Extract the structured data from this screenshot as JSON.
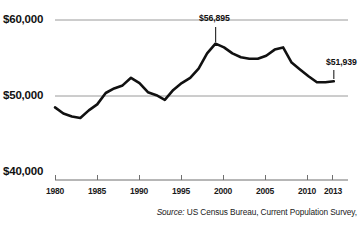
{
  "axes": {
    "y_labels": [
      "$60,000",
      "$50,000",
      "$40,000"
    ],
    "x_labels": [
      "1980",
      "1985",
      "1990",
      "1995",
      "2000",
      "2005",
      "2010",
      "2013"
    ]
  },
  "annotations": {
    "peak_label": "$56,895",
    "last_label": "$51,939"
  },
  "source": {
    "prefix": "Source:",
    "text": "US Census Bureau, Current Population Survey,"
  },
  "colors": {
    "line": "#111111",
    "gridline": "#999999",
    "axis": "#666666",
    "text": "#1a1a1a",
    "background": "#ffffff"
  },
  "chart_data": {
    "type": "line",
    "title": "",
    "xlabel": "",
    "ylabel": "",
    "xlim": [
      1980,
      2013
    ],
    "ylim": [
      40000,
      60000
    ],
    "grid": true,
    "gridlines": [
      40000,
      50000,
      60000
    ],
    "legend": "none",
    "x_tick_values": [
      1980,
      1985,
      1990,
      1995,
      2000,
      2005,
      2010,
      2013
    ],
    "x": [
      1980,
      1981,
      1982,
      1983,
      1984,
      1985,
      1986,
      1987,
      1988,
      1989,
      1990,
      1991,
      1992,
      1993,
      1994,
      1995,
      1996,
      1997,
      1998,
      1999,
      2000,
      2001,
      2002,
      2003,
      2004,
      2005,
      2006,
      2007,
      2008,
      2009,
      2010,
      2011,
      2012,
      2013
    ],
    "series": [
      {
        "name": "Median household income",
        "values": [
          48500,
          47700,
          47300,
          47100,
          48100,
          48900,
          50400,
          51000,
          51400,
          52400,
          51700,
          50500,
          50100,
          49500,
          50800,
          51700,
          52400,
          53600,
          55600,
          56895,
          56400,
          55600,
          55100,
          54900,
          54900,
          55300,
          56100,
          56400,
          54400,
          53500,
          52600,
          51800,
          51800,
          51939
        ]
      }
    ],
    "annotated_points": [
      {
        "x": 1999,
        "y": 56895,
        "label": "$56,895"
      },
      {
        "x": 2013,
        "y": 51939,
        "label": "$51,939"
      }
    ]
  }
}
